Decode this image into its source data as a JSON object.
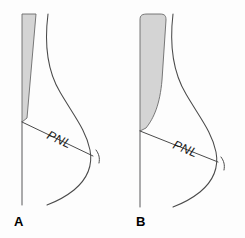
{
  "figure": {
    "background_color": "#fdfdfd",
    "width": 245,
    "height": 238
  },
  "style": {
    "contour_stroke": "#4a4a4a",
    "wedge_fill": "#d4d4d4",
    "wedge_stroke": "#6a6a6a",
    "label_color": "#1b1b1b",
    "letter_color": "#000000"
  },
  "panels": [
    {
      "id": "panel-a",
      "letter": "A",
      "measurement_label": "PNL",
      "wedge_name": "narrow-wedge",
      "wedge_fill": "#d4d4d4",
      "geometry": {
        "wedge_path": "M 22,14 L 36,14 L 27,118 L 22,122 Z",
        "contour_path": "M 48,14 C 44,46 48,72 60,92 C 74,116 86,130 90,150 C 93,166 86,180 74,190 C 64,198 55,202 47,205",
        "chest_line": "M 22,122 L 22,205",
        "pnl_line": "M 22,122 L 93,156",
        "tick_path": "M 96,150 C 99,154 100,158 99,163",
        "label_x": 46,
        "label_y": 138,
        "label_rotation": 25,
        "letter_x": 14,
        "letter_y": 226
      }
    },
    {
      "id": "panel-b",
      "letter": "B",
      "measurement_label": "PNL",
      "wedge_name": "wide-wedge",
      "wedge_fill": "#d4d4d4",
      "geometry": {
        "wedge_path": "M 18,20 C 18,15 20,14 26,14 L 38,14 C 43,14 44,16 44,20 L 40,80 C 38,104 32,118 24,128 L 18,131 Z",
        "contour_path": "M 51,14 C 47,48 52,74 64,94 C 78,118 90,132 94,152 C 97,168 90,182 78,192 C 68,200 59,204 51,207",
        "chest_line": "M 18,131 L 18,207",
        "pnl_line": "M 18,131 L 96,162",
        "tick_path": "M 99,157 C 102,161 103,165 102,170",
        "label_x": 50,
        "label_y": 148,
        "label_rotation": 22,
        "letter_x": 14,
        "letter_y": 226
      }
    }
  ]
}
